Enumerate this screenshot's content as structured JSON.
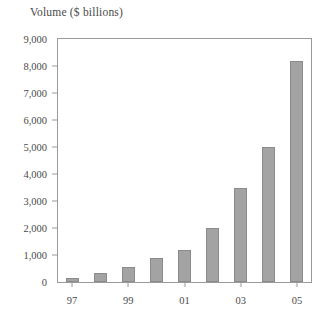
{
  "chart_data": {
    "type": "bar",
    "title": "Volume ($ billions)",
    "xlabel": "",
    "ylabel": "",
    "categories": [
      "97",
      "98",
      "99",
      "00",
      "01",
      "02",
      "03",
      "04",
      "05"
    ],
    "values": [
      150,
      350,
      550,
      900,
      1200,
      2000,
      3500,
      5000,
      8200
    ],
    "ylim": [
      0,
      9000
    ],
    "yticks": [
      0,
      1000,
      2000,
      3000,
      4000,
      5000,
      6000,
      7000,
      8000,
      9000
    ],
    "ytick_labels": [
      "0",
      "1,000",
      "2,000",
      "3,000",
      "4,000",
      "5,000",
      "6,000",
      "7,000",
      "8,000",
      "9,000"
    ],
    "xtick_labels": [
      "97",
      "99",
      "01",
      "03",
      "05"
    ],
    "xtick_indices": [
      0,
      2,
      4,
      6,
      8
    ],
    "grid": false,
    "legend": null,
    "bar_color": "#a3a3a3",
    "bar_edge_color": "#8b8b8b",
    "frame_color": "#9a9a9a"
  }
}
